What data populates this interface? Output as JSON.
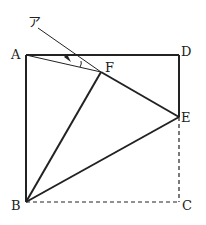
{
  "labels": {
    "A": "A",
    "B": "B",
    "C": "C",
    "D": "D",
    "E": "E",
    "F": "F",
    "angle": "ア"
  },
  "colors": {
    "line": "#222222",
    "background": "#ffffff"
  }
}
